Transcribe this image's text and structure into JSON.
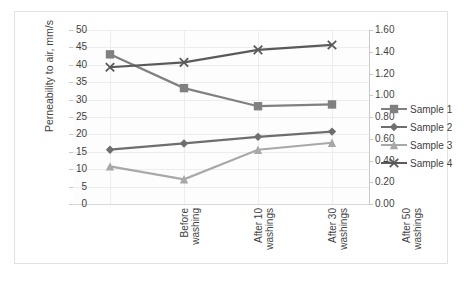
{
  "chart_data": {
    "type": "line",
    "title": "",
    "xlabel": "",
    "ylabel": "Perneability to air, mm/s",
    "categories": [
      "Before\nwashing",
      "After 10\nwashings",
      "After 30\nwashings",
      "After 50\nwashings"
    ],
    "ylim": [
      0,
      50
    ],
    "yticks": [
      "0",
      "5",
      "10",
      "15",
      "20",
      "25",
      "30",
      "35",
      "40",
      "45",
      "50"
    ],
    "y2lim": [
      0.0,
      1.6
    ],
    "y2ticks": [
      "0.00",
      "0.20",
      "0.40",
      "0.60",
      "0.80",
      "1.00",
      "1.20",
      "1.40",
      "1.60"
    ],
    "grid": true,
    "legend_position": "right",
    "series": [
      {
        "name": "Sample 1",
        "values": [
          43.0,
          33.3,
          28.1,
          28.6
        ],
        "color": "#808080",
        "marker": "square",
        "axis": "left"
      },
      {
        "name": "Sample 2",
        "values": [
          15.6,
          17.4,
          19.3,
          20.8
        ],
        "color": "#6e6e6e",
        "marker": "diamond",
        "axis": "left"
      },
      {
        "name": "Sample 3",
        "values": [
          10.8,
          7.1,
          15.6,
          17.6
        ],
        "color": "#a8a8a8",
        "marker": "triangle",
        "axis": "left"
      },
      {
        "name": "Sample 4",
        "values": [
          39.3,
          40.7,
          44.3,
          45.7
        ],
        "color": "#5a5a5a",
        "marker": "x",
        "axis": "left"
      }
    ]
  },
  "legend": {
    "items": [
      {
        "label": "Sample 1"
      },
      {
        "label": "Sample 2"
      },
      {
        "label": "Sample 3"
      },
      {
        "label": "Sample 4"
      }
    ]
  }
}
